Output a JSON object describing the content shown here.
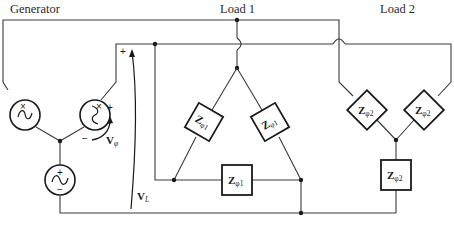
{
  "diagram": {
    "labels": {
      "generator": "Generator",
      "load1": "Load 1",
      "load2": "Load 2"
    },
    "voltages": {
      "phase": {
        "symbol": "V",
        "subscript": "φ"
      },
      "line": {
        "symbol": "V",
        "subscript": "L"
      }
    },
    "impedances": {
      "load1": {
        "symbol": "Z",
        "subscript": "φ1",
        "count": 3,
        "connection": "delta"
      },
      "load2": {
        "symbol": "Z",
        "subscript": "φ2",
        "count": 3,
        "connection": "wye"
      }
    },
    "generator": {
      "connection": "wye",
      "sources": 3
    },
    "polarity": {
      "plus": "+",
      "minus": "−",
      "dot": "×"
    },
    "colors": {
      "line": "#3a3a3a",
      "stroke": "#1a1a1a",
      "background": "#ffffff"
    }
  }
}
